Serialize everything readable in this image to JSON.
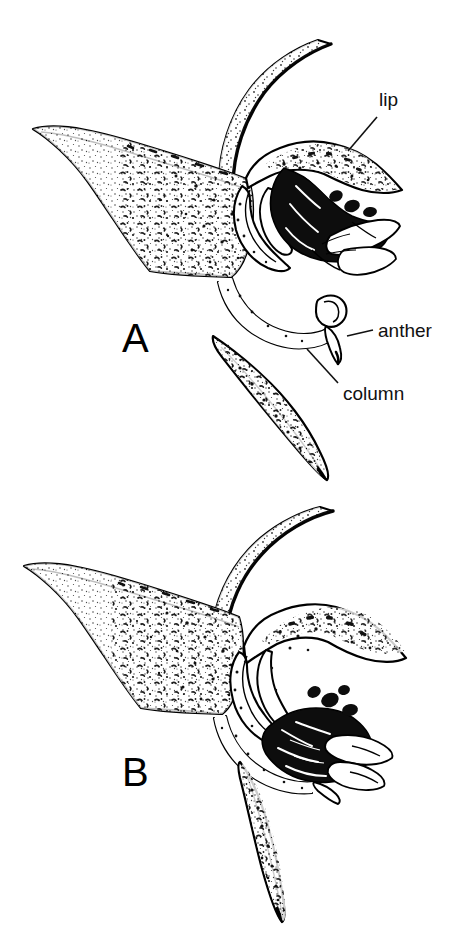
{
  "figure": {
    "type": "botanical-line-drawing",
    "background_color": "#ffffff",
    "ink_color": "#000000",
    "panels": [
      {
        "id": "A",
        "letter": "A",
        "description": "Orchid flower in side view with pedicel curving up to the right, spreading stippled lateral sepal to the left, downward-pointing stippled sepal, arched column and dark lip with pollinia",
        "parts_labeled": [
          "lip",
          "anther",
          "column"
        ]
      },
      {
        "id": "B",
        "letter": "B",
        "description": "Second orchid flower in side view, same species, lip tilted forward and column held lower, with lateral sepal to the left and a nearly vertical lower sepal",
        "parts_labeled": []
      }
    ]
  },
  "annotations": [
    {
      "id": "lip",
      "label": "lip",
      "panel": "A",
      "leader_from": [
        377,
        118
      ],
      "leader_to": [
        347,
        150
      ]
    },
    {
      "id": "anther",
      "label": "anther",
      "panel": "A",
      "leader_from": [
        372,
        330
      ],
      "leader_to": [
        346,
        337
      ]
    },
    {
      "id": "column",
      "label": "column",
      "panel": "A",
      "leader_from": [
        338,
        382
      ],
      "leader_to": [
        310,
        350
      ]
    }
  ],
  "panel_letters": {
    "a": "A",
    "b": "B"
  },
  "colors": {
    "ink": "#000000",
    "paper": "#ffffff",
    "stipple": "#111111"
  }
}
